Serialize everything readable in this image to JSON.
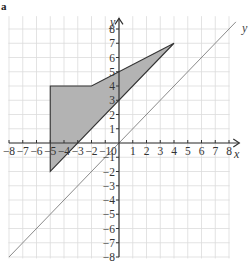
{
  "part_label": "a",
  "axes": {
    "x_name": "x",
    "y_name": "y",
    "x_range": [
      -8,
      8
    ],
    "y_range": [
      -8,
      8
    ],
    "x_ticks": [
      -8,
      -7,
      -6,
      -5,
      -4,
      -3,
      -2,
      -1,
      1,
      2,
      3,
      4,
      5,
      6,
      7,
      8
    ],
    "y_ticks": [
      8,
      7,
      6,
      5,
      4,
      3,
      2,
      1,
      -1,
      -2,
      -3,
      -4,
      -5,
      -6,
      -7,
      -8
    ],
    "origin_label": "0",
    "grid": true
  },
  "shape": {
    "name": "shaded-quadrilateral",
    "vertices": [
      [
        -5,
        4
      ],
      [
        -2,
        4
      ],
      [
        4,
        7
      ],
      [
        -5,
        -2
      ]
    ],
    "fill": "#b3b3b3",
    "stroke": "#333333"
  },
  "mirror_line": {
    "equation": "y = x",
    "from": [
      -8,
      -8
    ],
    "to": [
      8.5,
      8.5
    ],
    "label": "y",
    "color": "#8a8a8a"
  },
  "colors": {
    "grid": "#dcdcdc",
    "axis": "#333333"
  }
}
